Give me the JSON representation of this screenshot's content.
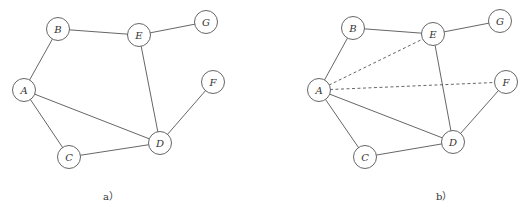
{
  "node_radius": 11.5,
  "graphs": [
    {
      "id": "a",
      "caption": "a）",
      "caption_pos": [
        103,
        200
      ],
      "nodes": [
        {
          "id": "A",
          "x": 24,
          "y": 90
        },
        {
          "id": "B",
          "x": 58,
          "y": 29
        },
        {
          "id": "C",
          "x": 69,
          "y": 157
        },
        {
          "id": "D",
          "x": 160,
          "y": 143
        },
        {
          "id": "E",
          "x": 139,
          "y": 35
        },
        {
          "id": "F",
          "x": 213,
          "y": 82
        },
        {
          "id": "G",
          "x": 206,
          "y": 22
        }
      ],
      "edges": [
        {
          "from": "A",
          "to": "B",
          "style": "solid"
        },
        {
          "from": "B",
          "to": "E",
          "style": "solid"
        },
        {
          "from": "E",
          "to": "G",
          "style": "solid"
        },
        {
          "from": "E",
          "to": "D",
          "style": "solid"
        },
        {
          "from": "A",
          "to": "D",
          "style": "solid"
        },
        {
          "from": "A",
          "to": "C",
          "style": "solid"
        },
        {
          "from": "C",
          "to": "D",
          "style": "solid"
        },
        {
          "from": "D",
          "to": "F",
          "style": "solid"
        }
      ]
    },
    {
      "id": "b",
      "caption": "b）",
      "caption_pos": [
        436,
        200
      ],
      "nodes": [
        {
          "id": "A",
          "x": 319,
          "y": 90
        },
        {
          "id": "B",
          "x": 353,
          "y": 28
        },
        {
          "id": "C",
          "x": 365,
          "y": 157
        },
        {
          "id": "D",
          "x": 453,
          "y": 142
        },
        {
          "id": "E",
          "x": 433,
          "y": 34
        },
        {
          "id": "F",
          "x": 506,
          "y": 82
        },
        {
          "id": "G",
          "x": 500,
          "y": 21
        }
      ],
      "edges": [
        {
          "from": "A",
          "to": "B",
          "style": "solid"
        },
        {
          "from": "B",
          "to": "E",
          "style": "solid"
        },
        {
          "from": "E",
          "to": "G",
          "style": "solid"
        },
        {
          "from": "E",
          "to": "D",
          "style": "solid"
        },
        {
          "from": "A",
          "to": "D",
          "style": "solid"
        },
        {
          "from": "A",
          "to": "C",
          "style": "solid"
        },
        {
          "from": "C",
          "to": "D",
          "style": "solid"
        },
        {
          "from": "D",
          "to": "F",
          "style": "solid"
        },
        {
          "from": "A",
          "to": "E",
          "style": "dashed"
        },
        {
          "from": "A",
          "to": "F",
          "style": "dashed"
        }
      ]
    }
  ]
}
